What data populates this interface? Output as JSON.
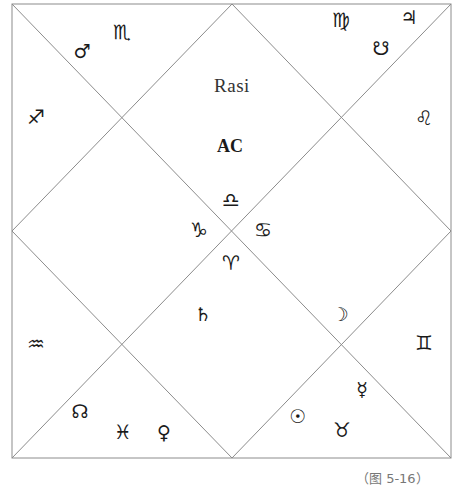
{
  "chart": {
    "title": "Rasi",
    "ascendant_label": "AC",
    "caption": "（图 5-16）",
    "frame": {
      "x1": 12,
      "y1": 4,
      "x2": 451,
      "y2": 458,
      "cx": 232,
      "cy": 231
    },
    "line_color": "#8c8c8c",
    "text_color": "#1a1a1a"
  },
  "houses": [
    {
      "house": 1,
      "sign": "libra",
      "sign_glyph": "♎",
      "planets": []
    },
    {
      "house": 2,
      "sign": "scorpio",
      "sign_glyph": "♏",
      "planets": [
        {
          "name": "mars",
          "glyph": "♂"
        }
      ]
    },
    {
      "house": 3,
      "sign": "sagittarius",
      "sign_glyph": "♐",
      "planets": []
    },
    {
      "house": 4,
      "sign": "capricorn",
      "sign_glyph": "♑",
      "planets": []
    },
    {
      "house": 5,
      "sign": "aquarius",
      "sign_glyph": "♒",
      "planets": []
    },
    {
      "house": 6,
      "sign": "pisces",
      "sign_glyph": "♓",
      "planets": [
        {
          "name": "rahu",
          "glyph": "☊"
        },
        {
          "name": "venus",
          "glyph": "♀"
        }
      ]
    },
    {
      "house": 7,
      "sign": "aries",
      "sign_glyph": "♈",
      "planets": [
        {
          "name": "saturn",
          "glyph": "♄"
        }
      ]
    },
    {
      "house": 8,
      "sign": "taurus",
      "sign_glyph": "♉",
      "planets": [
        {
          "name": "mercury",
          "glyph": "☿"
        },
        {
          "name": "sun",
          "glyph": "☉"
        }
      ]
    },
    {
      "house": 9,
      "sign": "gemini",
      "sign_glyph": "♊",
      "planets": []
    },
    {
      "house": 10,
      "sign": "cancer",
      "sign_glyph": "♋",
      "planets": [
        {
          "name": "moon",
          "glyph": "☽"
        }
      ]
    },
    {
      "house": 11,
      "sign": "leo",
      "sign_glyph": "♌",
      "planets": []
    },
    {
      "house": 12,
      "sign": "virgo",
      "sign_glyph": "♍",
      "planets": [
        {
          "name": "jupiter",
          "glyph": "♃"
        },
        {
          "name": "ketu",
          "glyph": "☋"
        }
      ]
    }
  ],
  "glyphs": {
    "libra": "♎",
    "scorpio": "♏",
    "sagittarius": "♐",
    "capricorn": "♑",
    "aquarius": "♒",
    "pisces": "♓",
    "aries": "♈",
    "taurus": "♉",
    "gemini": "♊",
    "cancer": "♋",
    "leo": "♌",
    "virgo": "♍",
    "mars": "♂",
    "jupiter": "♃",
    "ketu": "☋",
    "rahu": "☊",
    "venus": "♀",
    "saturn": "♄",
    "moon": "☽",
    "mercury": "☿",
    "sun": "☉"
  }
}
